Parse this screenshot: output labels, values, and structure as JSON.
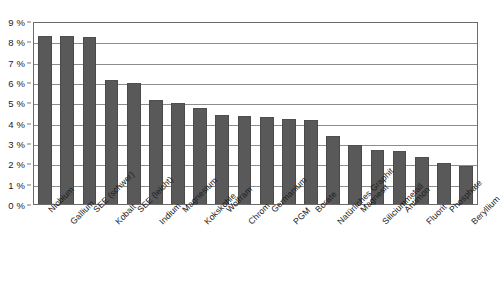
{
  "chart_data": {
    "type": "bar",
    "title": "",
    "subtitle": "",
    "xlabel": "",
    "ylabel": "",
    "ylim": [
      0,
      9
    ],
    "ytick_labels": [
      "9 %",
      "8 %",
      "7 %",
      "6 %",
      "5 %",
      "4 %",
      "3 %",
      "2 %",
      "1 %",
      "0 %"
    ],
    "ytick_values": [
      9,
      8,
      7,
      6,
      5,
      4,
      3,
      2,
      1,
      0
    ],
    "grid": "horizontal",
    "legend": "none",
    "bar_color": "#595959",
    "axis_color": "#6b6b6b",
    "gridline_color": "#8c8c8c",
    "categories": [
      "Niobium",
      "Gallium",
      "SEE (schwer)",
      "Kobalt",
      "SEE (leicht)",
      "Indium",
      "Magnesium",
      "Kokskohle",
      "Wolfram",
      "Chrom",
      "Germanium",
      "PGM",
      "Borate",
      "Natürliches Graphit",
      "Magnesit",
      "Siliciummetall",
      "Antimon",
      "Fluorit",
      "Phosphate",
      "Beryllium"
    ],
    "values": [
      8.25,
      8.25,
      8.2,
      6.1,
      5.95,
      5.1,
      4.95,
      4.7,
      4.4,
      4.35,
      4.3,
      4.2,
      4.15,
      3.35,
      2.9,
      2.65,
      2.6,
      2.3,
      2.0,
      1.85
    ]
  }
}
